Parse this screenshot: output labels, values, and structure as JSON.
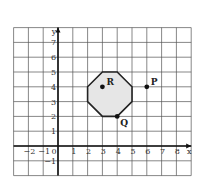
{
  "diagram": {
    "type": "coordinate-grid",
    "axes": {
      "x_label": "x",
      "y_label": "y",
      "x_ticks": [
        "-2",
        "-1",
        "0",
        "1",
        "2",
        "3",
        "4",
        "5",
        "6",
        "7",
        "8"
      ],
      "y_ticks": [
        "-1",
        "1",
        "2",
        "3",
        "4",
        "5",
        "6",
        "7"
      ],
      "x_range": [
        -3,
        9
      ],
      "y_range": [
        -2,
        8
      ]
    },
    "octagon": {
      "vertices": [
        [
          3,
          5
        ],
        [
          4,
          5
        ],
        [
          5,
          4
        ],
        [
          5,
          3
        ],
        [
          4,
          2
        ],
        [
          3,
          2
        ],
        [
          2,
          3
        ],
        [
          2,
          4
        ]
      ],
      "fill": "#e6e6e6",
      "stroke": "#222222"
    },
    "points": [
      {
        "label": "R",
        "x": 3,
        "y": 4
      },
      {
        "label": "P",
        "x": 6,
        "y": 4
      },
      {
        "label": "Q",
        "x": 4,
        "y": 2
      }
    ]
  }
}
